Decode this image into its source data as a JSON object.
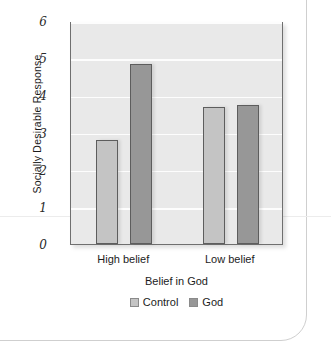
{
  "chart_data": {
    "type": "bar",
    "title": "",
    "xlabel": "Belief in God",
    "ylabel": "Socially Desirable Response",
    "categories": [
      "High belief",
      "Low belief"
    ],
    "series": [
      {
        "name": "Control",
        "color": "#c4c4c4",
        "values": [
          2.8,
          3.68
        ]
      },
      {
        "name": "God",
        "color": "#979797",
        "values": [
          4.85,
          3.75
        ]
      }
    ],
    "ylim": [
      0,
      6
    ],
    "yticks": [
      0,
      1,
      2,
      3,
      4,
      5,
      6
    ],
    "ytick_labels": [
      "0",
      "1",
      "2",
      "3",
      "4",
      "5",
      "6"
    ],
    "grid": true,
    "grid_color": "#fdfdfd",
    "plot_background": "#e9e9e9",
    "legend_position": "bottom"
  },
  "legend": {
    "items": [
      {
        "label": "Control"
      },
      {
        "label": "God"
      }
    ]
  }
}
